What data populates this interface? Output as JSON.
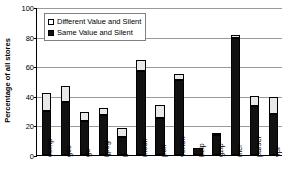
{
  "chart_data": {
    "type": "bar",
    "title": "",
    "subtitle": "",
    "xlabel": "",
    "ylabel": "Percentage of all stores",
    "stacked": true,
    "grid": true,
    "legend_position": "top-left",
    "ylim": [
      0,
      100
    ],
    "yticks": [
      0,
      20,
      40,
      60,
      80,
      100
    ],
    "ytick_labels": [
      "0",
      "20",
      "40",
      "60",
      "80",
      "100"
    ],
    "categories": [
      "comp",
      "gcc",
      "go",
      "ijpeg",
      "li",
      "m88k",
      "perl",
      "vortex",
      "bzip",
      "gzip",
      "mcf",
      "parser",
      "vpr"
    ],
    "series": [
      {
        "name": "Same Value and Silent",
        "color": "#111111",
        "values": [
          30,
          36,
          23,
          27,
          12,
          57,
          25,
          51,
          5,
          13.5,
          79,
          33,
          28
        ]
      },
      {
        "name": "Different Value and Silent",
        "color": "#e8e8e8",
        "values": [
          12,
          10.5,
          6,
          5,
          6,
          7,
          9,
          4,
          0,
          0.5,
          2,
          7,
          11
        ]
      }
    ],
    "totals": [
      42,
      46.5,
      29,
      32,
      18,
      64,
      34,
      55,
      5,
      14,
      81,
      40,
      39
    ]
  },
  "legend": {
    "items": [
      {
        "label": "Different Value and Silent",
        "swatch": "open-square-swatch"
      },
      {
        "label": "Same Value and Silent",
        "swatch": "filled-square-swatch"
      }
    ]
  }
}
